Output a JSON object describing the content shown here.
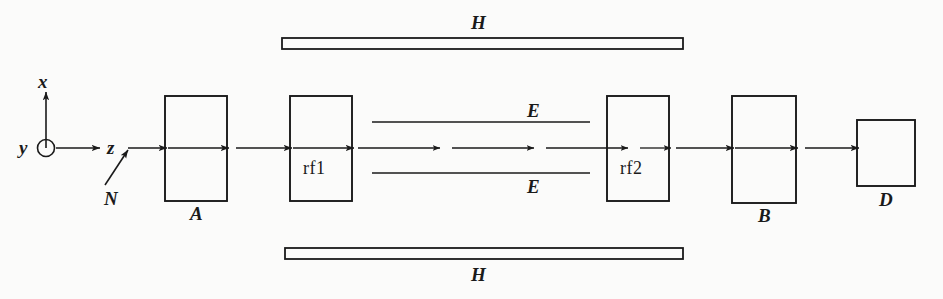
{
  "figure": {
    "background_color": "#fbfbfa",
    "ink_color": "#1a1a1a",
    "width": 943,
    "height": 299
  },
  "axes": {
    "name": "coordinate-axes",
    "origin": {
      "x": 46,
      "y": 148
    },
    "x_label": "x",
    "y_label": "y",
    "z_label": "z",
    "y_symbol": "out-of-page-circle"
  },
  "beam": {
    "source_label": "N",
    "baseline_y": 148,
    "direction": "left-to-right"
  },
  "components": [
    {
      "id": "magnet-a",
      "label": "A",
      "label_position": "below",
      "type": "rect",
      "x": 165,
      "y": 96,
      "w": 62,
      "h": 105
    },
    {
      "id": "rf-cavity-1",
      "label": "rf1",
      "label_position": "inside",
      "type": "rect",
      "x": 290,
      "y": 96,
      "w": 62,
      "h": 105
    },
    {
      "id": "rf-cavity-2",
      "label": "rf2",
      "label_position": "inside",
      "type": "rect",
      "x": 607,
      "y": 96,
      "w": 62,
      "h": 105
    },
    {
      "id": "magnet-b",
      "label": "B",
      "label_position": "below",
      "type": "rect",
      "x": 732,
      "y": 96,
      "w": 64,
      "h": 107
    },
    {
      "id": "detector",
      "label": "D",
      "label_position": "below",
      "type": "rect",
      "x": 857,
      "y": 120,
      "w": 58,
      "h": 66
    }
  ],
  "field_plates": [
    {
      "id": "h-plate-top",
      "label": "H",
      "label_position": "above",
      "x": 282,
      "y": 38,
      "w": 401,
      "h": 11
    },
    {
      "id": "h-plate-bottom",
      "label": "H",
      "label_position": "below",
      "x": 285,
      "y": 248,
      "w": 398,
      "h": 11
    }
  ],
  "field_lines": [
    {
      "id": "e-line-top",
      "label": "E",
      "label_position": "above",
      "x1": 372,
      "y1": 122,
      "x2": 590,
      "y2": 122
    },
    {
      "id": "e-line-bottom",
      "label": "E",
      "label_position": "below",
      "x1": 372,
      "y1": 173,
      "x2": 590,
      "y2": 173
    }
  ],
  "drift_arrows": {
    "count": 4,
    "segments": [
      {
        "x1": 358,
        "x2": 438
      },
      {
        "x1": 452,
        "x2": 532
      },
      {
        "x1": 546,
        "x2": 626
      },
      {
        "x1": 640,
        "x2": 690
      }
    ]
  },
  "labels": {
    "x": "x",
    "y": "y",
    "z": "z",
    "N": "N",
    "A": "A",
    "B": "B",
    "D": "D",
    "E_top": "E",
    "E_bottom": "E",
    "H_top": "H",
    "H_bottom": "H",
    "rf1": "rf1",
    "rf2": "rf2"
  }
}
